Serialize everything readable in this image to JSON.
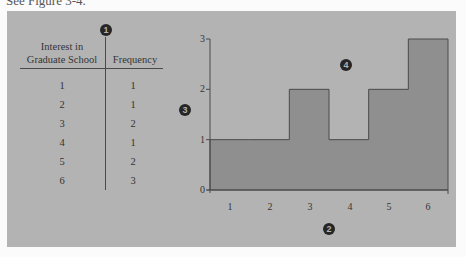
{
  "header_fragment": "See Figure 3-4.",
  "table": {
    "columns": [
      "Interest in Graduate School",
      "Frequency"
    ],
    "col1_line1": "Interest in",
    "col1_line2": "Graduate School",
    "col2": "Frequency",
    "rows": [
      {
        "value": "1",
        "frequency": "1"
      },
      {
        "value": "2",
        "frequency": "1"
      },
      {
        "value": "3",
        "frequency": "2"
      },
      {
        "value": "4",
        "frequency": "1"
      },
      {
        "value": "5",
        "frequency": "2"
      },
      {
        "value": "6",
        "frequency": "3"
      }
    ]
  },
  "markers": {
    "m1": "1",
    "m2": "2",
    "m3": "3",
    "m4": "4"
  },
  "colors": {
    "panel": "#b3b3b3",
    "bar_fill": "#8f8f8f",
    "line": "#4a4a4a"
  },
  "chart_data": {
    "type": "bar",
    "title": "",
    "xlabel": "",
    "ylabel": "",
    "categories": [
      "1",
      "2",
      "3",
      "4",
      "5",
      "6"
    ],
    "values": [
      1,
      1,
      2,
      1,
      2,
      3
    ],
    "yticks": [
      "0",
      "1",
      "2",
      "3"
    ],
    "ylim": [
      0,
      3
    ],
    "grid": false,
    "legend": null,
    "annotations": [
      "1 (table divider)",
      "2 (x-axis)",
      "3 (y-axis)",
      "4 (histogram area)"
    ],
    "bar_style": "histogram, adjacent bars with no gaps"
  }
}
